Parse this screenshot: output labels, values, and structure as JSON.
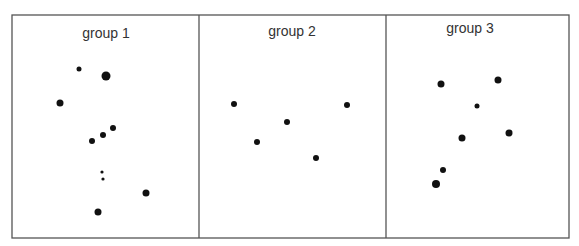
{
  "chart_data": {
    "type": "scatter",
    "title": "",
    "xlabel": "",
    "ylabel": "",
    "axes_visible": false,
    "grid": false,
    "legend": null,
    "frame": {
      "left": 12,
      "top": 15,
      "right": 569,
      "bottom": 238,
      "stroke": "#555555"
    },
    "dividers_x": [
      199,
      386
    ],
    "point_color": "#111111",
    "panels": [
      {
        "label": "group 1",
        "label_pos": [
          106,
          38
        ],
        "points": [
          {
            "x": 79,
            "y": 69,
            "r": 2.5
          },
          {
            "x": 106,
            "y": 76,
            "r": 4.5
          },
          {
            "x": 60,
            "y": 103,
            "r": 3.5
          },
          {
            "x": 113,
            "y": 128,
            "r": 3
          },
          {
            "x": 103,
            "y": 135,
            "r": 3
          },
          {
            "x": 92,
            "y": 141,
            "r": 3
          },
          {
            "x": 102,
            "y": 172,
            "r": 1.6
          },
          {
            "x": 103,
            "y": 179,
            "r": 1.6
          },
          {
            "x": 146,
            "y": 193,
            "r": 3.5
          },
          {
            "x": 98,
            "y": 212,
            "r": 3.5
          }
        ]
      },
      {
        "label": "group 2",
        "label_pos": [
          292,
          36
        ],
        "points": [
          {
            "x": 234,
            "y": 104,
            "r": 3
          },
          {
            "x": 347,
            "y": 105,
            "r": 3
          },
          {
            "x": 287,
            "y": 122,
            "r": 3
          },
          {
            "x": 257,
            "y": 142,
            "r": 3
          },
          {
            "x": 316,
            "y": 158,
            "r": 3
          }
        ]
      },
      {
        "label": "group 3",
        "label_pos": [
          470,
          33
        ],
        "points": [
          {
            "x": 441,
            "y": 84,
            "r": 3.5
          },
          {
            "x": 498,
            "y": 80,
            "r": 3.5
          },
          {
            "x": 477,
            "y": 106,
            "r": 2.5
          },
          {
            "x": 462,
            "y": 138,
            "r": 3.5
          },
          {
            "x": 509,
            "y": 133,
            "r": 3.5
          },
          {
            "x": 443,
            "y": 170,
            "r": 3
          },
          {
            "x": 436,
            "y": 184,
            "r": 4
          }
        ]
      }
    ]
  }
}
